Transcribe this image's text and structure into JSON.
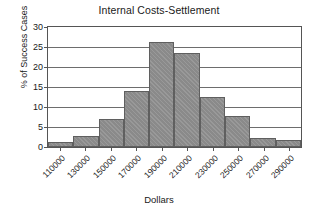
{
  "chart_data": {
    "type": "bar",
    "title": "Internal Costs-Settlement",
    "xlabel": "Dollars",
    "ylabel": "% of Success Cases",
    "categories": [
      "110000",
      "130000",
      "150000",
      "170000",
      "190000",
      "210000",
      "230000",
      "250000",
      "270000",
      "290000"
    ],
    "values": [
      1.3,
      2.7,
      7.1,
      14.0,
      26.2,
      23.4,
      12.5,
      7.7,
      2.3,
      1.8
    ],
    "ylim": [
      0,
      30
    ],
    "yticks": [
      0,
      5,
      10,
      15,
      20,
      25,
      30
    ],
    "ytick_labels": [
      "0",
      "5",
      "10",
      "15",
      "20",
      "25",
      "30"
    ],
    "grid": true,
    "legend": false,
    "bar_color": "#8a8a8a",
    "bar_edge_color": "#5f5f5f",
    "axis_color": "#555555",
    "background": "#ffffff"
  }
}
